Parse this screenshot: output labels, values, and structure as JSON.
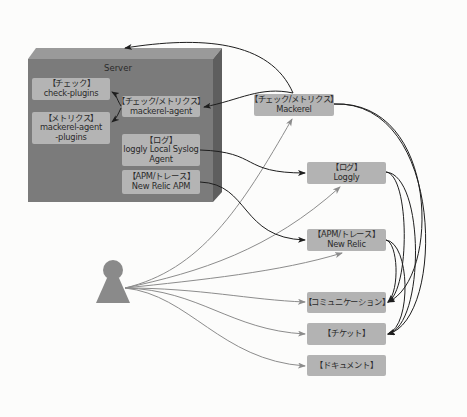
{
  "diagram": {
    "server": {
      "label": "Server",
      "components": [
        {
          "id": "check-plugins",
          "category": "【チェック】",
          "name": "check-plugins"
        },
        {
          "id": "mackerel-agent-plugins",
          "category": "【メトリクス】",
          "name": "mackerel-agent",
          "name2": "-plugins"
        },
        {
          "id": "mackerel-agent",
          "category": "【チェック/メトリクス】",
          "name": "mackerel-agent"
        },
        {
          "id": "loggly-agent",
          "category": "【ログ】",
          "name": "loggly Local Syslog",
          "name2": "Agent"
        },
        {
          "id": "newrelic-apm",
          "category": "【APM/トレース】",
          "name": "New Relic APM"
        }
      ]
    },
    "services": [
      {
        "id": "mackerel",
        "category": "【チェック/メトリクス】",
        "name": "Mackerel"
      },
      {
        "id": "loggly",
        "category": "【ログ】",
        "name": "Loggly"
      },
      {
        "id": "newrelic",
        "category": "【APM/トレース】",
        "name": "New Relic"
      },
      {
        "id": "communication",
        "category": "【コミュニケーション】"
      },
      {
        "id": "ticket",
        "category": "【チケット】"
      },
      {
        "id": "document",
        "category": "【ドキュメント】"
      }
    ],
    "actor": {
      "id": "user",
      "icon": "person-icon"
    },
    "edges": [
      {
        "from": "mackerel-agent",
        "to": "check-plugins",
        "style": "dark"
      },
      {
        "from": "mackerel-agent",
        "to": "mackerel-agent-plugins",
        "style": "dark"
      },
      {
        "from": "mackerel",
        "to": "server",
        "style": "dark"
      },
      {
        "from": "mackerel",
        "to": "mackerel-agent",
        "style": "dark"
      },
      {
        "from": "loggly-agent",
        "to": "loggly",
        "style": "dark"
      },
      {
        "from": "newrelic-apm",
        "to": "newrelic",
        "style": "dark"
      },
      {
        "from": "mackerel",
        "to": "communication",
        "style": "dark"
      },
      {
        "from": "mackerel",
        "to": "ticket",
        "style": "dark"
      },
      {
        "from": "loggly",
        "to": "communication",
        "style": "dark"
      },
      {
        "from": "loggly",
        "to": "ticket",
        "style": "dark"
      },
      {
        "from": "newrelic",
        "to": "communication",
        "style": "dark"
      },
      {
        "from": "newrelic",
        "to": "ticket",
        "style": "dark"
      },
      {
        "from": "user",
        "to": "mackerel",
        "style": "gray"
      },
      {
        "from": "user",
        "to": "loggly",
        "style": "gray"
      },
      {
        "from": "user",
        "to": "newrelic",
        "style": "gray"
      },
      {
        "from": "user",
        "to": "communication",
        "style": "gray"
      },
      {
        "from": "user",
        "to": "ticket",
        "style": "gray"
      },
      {
        "from": "user",
        "to": "document",
        "style": "gray"
      }
    ],
    "colors": {
      "server_front": "#7b7b7b",
      "server_top": "#9a9a9a",
      "server_side": "#5e5e5e",
      "node_fill": "#b3b3b3",
      "dark_edge": "#1e1e1e",
      "gray_edge": "#8c8c8c",
      "actor": "#8a8a8a"
    }
  }
}
